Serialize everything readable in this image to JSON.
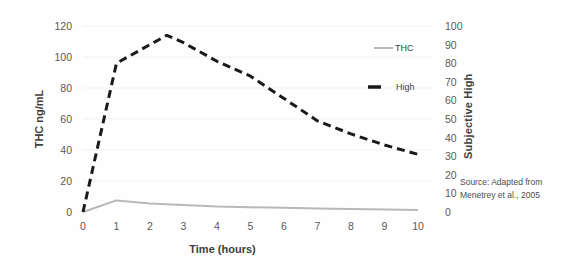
{
  "legend": {
    "items": [
      {
        "label": "THC",
        "color": "#b8b8b8",
        "style": "solid"
      },
      {
        "label": "High",
        "color": "#1a1a1a",
        "style": "dashed"
      }
    ]
  },
  "source_note": {
    "line1": "Source: Adapted from",
    "line2": "Menetrey et al., 2005"
  },
  "chart_data": {
    "type": "line",
    "title": "",
    "xlabel": "Time (hours)",
    "ylabel_left": "THC ng/mL",
    "ylabel_right": "Subjective High",
    "x_ticks": [
      0,
      1,
      2,
      3,
      4,
      5,
      6,
      7,
      8,
      9,
      10
    ],
    "left_ticks": [
      0,
      20,
      40,
      60,
      80,
      100,
      120
    ],
    "right_ticks": [
      0,
      10,
      20,
      30,
      40,
      50,
      60,
      70,
      80,
      90,
      100
    ],
    "xlim": [
      0,
      10
    ],
    "left_ylim": [
      0,
      120
    ],
    "right_ylim": [
      0,
      100
    ],
    "grid": "faint-horizontal",
    "legend_position": "inside-right",
    "series": [
      {
        "name": "THC",
        "axis": "left",
        "color": "#b8b8b8",
        "line_style": "solid",
        "x": [
          0,
          1,
          2,
          3,
          4,
          5,
          6,
          7,
          8,
          9,
          10
        ],
        "values": [
          0,
          7.5,
          5.5,
          4.5,
          3.5,
          3,
          2.7,
          2.3,
          2,
          1.6,
          1.2
        ]
      },
      {
        "name": "High",
        "axis": "right",
        "color": "#1a1a1a",
        "line_style": "dashed",
        "x": [
          0,
          1,
          2,
          2.5,
          3,
          4,
          5,
          6,
          7,
          8,
          9,
          10
        ],
        "values": [
          0,
          80,
          90,
          95,
          91,
          81,
          73,
          61,
          49,
          42,
          36,
          31
        ]
      }
    ]
  }
}
